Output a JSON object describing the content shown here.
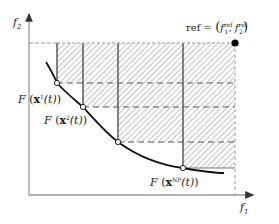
{
  "diagram": {
    "type": "hypervolume-indicator",
    "axes": {
      "x_label": "f",
      "x_sub": "1",
      "y_label": "f",
      "y_sub": "2"
    },
    "reference": {
      "label_prefix": "ref = ",
      "f1": "f",
      "f1_sub": "1",
      "f1_sup": "ref",
      "f2": "f",
      "f2_sub": "2",
      "f2_sup": "ref",
      "separator": ", "
    },
    "points": [
      {
        "label_prefix": "F",
        "x": "x",
        "sup": "1",
        "arg": "(t)"
      },
      {
        "label_prefix": "F",
        "x": "x",
        "sup": "2",
        "arg": "(t)"
      },
      {
        "label_prefix": "",
        "x": "",
        "sup": "",
        "arg": ""
      },
      {
        "label_prefix": "F",
        "x": "x",
        "sup": "NP",
        "arg": "(t)"
      }
    ],
    "colors": {
      "axis": "#9a9a9a",
      "curve": "#111111",
      "hatch": "#8a8a8a",
      "grid_solid": "#333333",
      "grid_dashed": "#555555",
      "ref_dot": "#000000"
    }
  }
}
